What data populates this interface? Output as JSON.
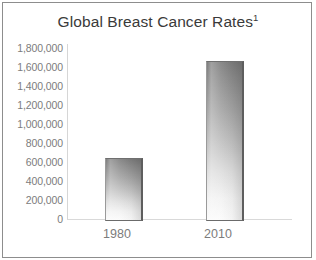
{
  "chart_data": {
    "type": "bar",
    "title": "Global Breast Cancer Rates",
    "title_superscript": "1",
    "categories": [
      "1980",
      "2010"
    ],
    "values": [
      640000,
      1640000
    ],
    "series": [
      {
        "name": "Global Breast Cancer Rates",
        "values": [
          640000,
          1640000
        ]
      }
    ],
    "xlabel": "",
    "ylabel": "",
    "ylim": [
      0,
      1800000
    ],
    "ytick_step": 200000,
    "ytick_labels": [
      "1,800,000",
      "1,600,000",
      "1,400,000",
      "1,200,000",
      "1,000,000",
      "800,000",
      "600,000",
      "400,000",
      "200,000",
      "0"
    ],
    "ytick_values": [
      1800000,
      1600000,
      1400000,
      1200000,
      1000000,
      800000,
      600000,
      400000,
      200000,
      0
    ],
    "grid": false,
    "legend": false,
    "legend_position": "none",
    "bar_fill_style": "vertical-gradient-gray",
    "colors": {
      "bar_top": "#7c7c7c",
      "bar_bottom": "#fbfbfb",
      "bar_edge": "#5e5e5e",
      "axis_line": "#d6d6d6",
      "tick_text": "#7c7c7c",
      "title_text": "#3a3a3a",
      "frame_border": "#8d8d8d",
      "background": "#ffffff"
    }
  }
}
